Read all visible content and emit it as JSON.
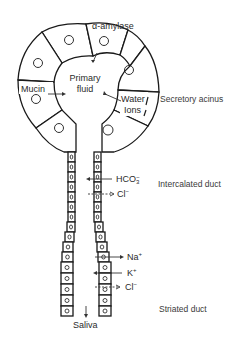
{
  "diagram": {
    "acinus": {
      "center_label_line1": "Primary",
      "center_label_line2": "fluid",
      "inputs": [
        {
          "label": "α-amylase",
          "direction": "into lumen"
        },
        {
          "label": "Mucin",
          "direction": "into lumen"
        },
        {
          "label_line1": "Water",
          "label_line2": "Ions",
          "direction": "into lumen"
        }
      ],
      "side_label": "Secretory acinus"
    },
    "intercalated_duct": {
      "side_label": "Intercalated duct",
      "transport": [
        {
          "ion": "HCO",
          "sub": "3",
          "sup": "−",
          "direction": "secreted into lumen"
        },
        {
          "ion": "Cl",
          "sup": "−",
          "direction": "absorbed from lumen"
        }
      ]
    },
    "striated_duct": {
      "side_label": "Striated duct",
      "transport": [
        {
          "ion": "Na",
          "sup": "+",
          "direction": "absorbed from lumen"
        },
        {
          "ion": "K",
          "sup": "+",
          "direction": "secreted into lumen"
        },
        {
          "ion": "Cl",
          "sup": "−",
          "direction": "absorbed from lumen"
        }
      ]
    },
    "output_label": "Saliva"
  }
}
